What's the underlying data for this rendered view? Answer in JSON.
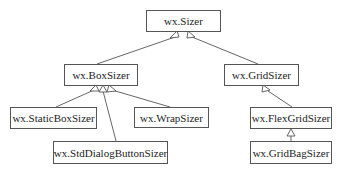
{
  "diagram": {
    "type": "class-hierarchy",
    "nodes": {
      "sizer": "wx.Sizer",
      "box_sizer": "wx.BoxSizer",
      "grid_sizer": "wx.GridSizer",
      "static_box_sizer": "wx.StaticBoxSizer",
      "wrap_sizer": "wx.WrapSizer",
      "std_dialog_button_sizer": "wx.StdDialogButtonSizer",
      "flex_grid_sizer": "wx.FlexGridSizer",
      "grid_bag_sizer": "wx.GridBagSizer"
    },
    "edges": [
      {
        "from": "wx.BoxSizer",
        "to": "wx.Sizer",
        "kind": "inherits"
      },
      {
        "from": "wx.GridSizer",
        "to": "wx.Sizer",
        "kind": "inherits"
      },
      {
        "from": "wx.StaticBoxSizer",
        "to": "wx.BoxSizer",
        "kind": "inherits"
      },
      {
        "from": "wx.StdDialogButtonSizer",
        "to": "wx.BoxSizer",
        "kind": "inherits"
      },
      {
        "from": "wx.WrapSizer",
        "to": "wx.BoxSizer",
        "kind": "inherits"
      },
      {
        "from": "wx.FlexGridSizer",
        "to": "wx.GridSizer",
        "kind": "inherits"
      },
      {
        "from": "wx.GridBagSizer",
        "to": "wx.FlexGridSizer",
        "kind": "inherits"
      }
    ],
    "line_color": "#555555"
  }
}
